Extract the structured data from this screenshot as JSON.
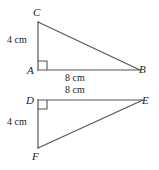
{
  "figure": {
    "stroke_color": "#555555",
    "text_color": "#222222",
    "background_color": "#ffffff",
    "stroke_width": 1.2,
    "triangles": [
      {
        "name": "triangle-abc",
        "vertices": {
          "C": {
            "label": "C",
            "x": 38,
            "y": 22
          },
          "A": {
            "label": "A",
            "x": 38,
            "y": 70
          },
          "B": {
            "label": "B",
            "x": 140,
            "y": 70
          }
        },
        "right_angle_at": "A",
        "measures": {
          "leg_vertical": "4 cm",
          "leg_horizontal": "8 cm"
        }
      },
      {
        "name": "triangle-def",
        "vertices": {
          "D": {
            "label": "D",
            "x": 38,
            "y": 100
          },
          "E": {
            "label": "E",
            "x": 143,
            "y": 100
          },
          "F": {
            "label": "F",
            "x": 38,
            "y": 148
          }
        },
        "right_angle_at": "D",
        "measures": {
          "leg_horizontal": "8 cm",
          "leg_vertical": "4 cm"
        }
      }
    ]
  }
}
